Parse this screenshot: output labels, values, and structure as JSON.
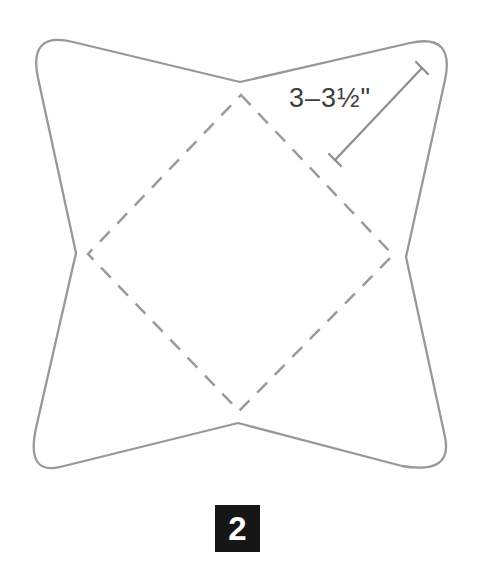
{
  "figure": {
    "type": "pattern-template-diagram",
    "measurement_label": "3–3½\"",
    "step_number": "2"
  },
  "colors": {
    "background": "#ffffff",
    "outline": "#989898",
    "fold_line": "#9a9a9a",
    "dimension_line": "#8f8f8f",
    "measurement_text": "#3e3e3e",
    "badge_background": "#161616",
    "badge_text": "#ffffff"
  }
}
